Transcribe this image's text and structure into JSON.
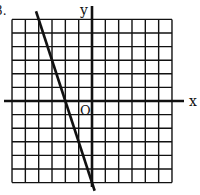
{
  "problem": {
    "number_label": "3."
  },
  "axes": {
    "x_label": "x",
    "y_label": "y",
    "origin_label": "O",
    "x_range": [
      -6,
      6
    ],
    "y_range": [
      -6,
      6
    ],
    "grid": true,
    "grid_step": 1
  },
  "chart_data": {
    "type": "line",
    "title": "",
    "xlabel": "x",
    "ylabel": "y",
    "xlim": [
      -6,
      6
    ],
    "ylim": [
      -6,
      6
    ],
    "grid": true,
    "series": [
      {
        "name": "line",
        "equation": "y = -3x - 6",
        "x": [
          -4.2,
          0.2
        ],
        "y": [
          6.6,
          -6.6
        ]
      }
    ],
    "annotations": [
      "O"
    ]
  },
  "colors": {
    "ink": "#111111",
    "background": "#ffffff"
  }
}
